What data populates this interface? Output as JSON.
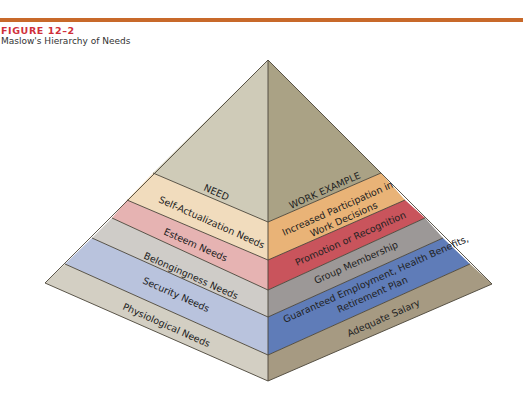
{
  "figure": {
    "number": "FIGURE 12–2",
    "title": "Maslow's Hierarchy of Needs",
    "accent_color": "#c8692a",
    "number_color": "#d0303a"
  },
  "pyramid": {
    "left_header": "NEED",
    "right_header": "WORK EXAMPLE",
    "levels": [
      {
        "need": "Self-Actualization Needs",
        "example_line1": "Increased Participation in",
        "example_line2": "Work Decisions",
        "left_color": "#f1dcbd",
        "right_color": "#e9b377"
      },
      {
        "need": "Esteem Needs",
        "example_line1": "Promotion or Recognition",
        "example_line2": "",
        "left_color": "#e6b3b2",
        "right_color": "#c9545c"
      },
      {
        "need": "Belongingness Needs",
        "example_line1": "Group Membership",
        "example_line2": "",
        "left_color": "#cfccc8",
        "right_color": "#9c9897"
      },
      {
        "need": "Security Needs",
        "example_line1": "Guaranteed Employment, Health Benefits,",
        "example_line2": "Retirement Plan",
        "left_color": "#b9c3dd",
        "right_color": "#5f7cb8"
      },
      {
        "need": "Physiological Needs",
        "example_line1": "Adequate Salary",
        "example_line2": "",
        "left_color": "#d3cfc3",
        "right_color": "#a69a82"
      }
    ],
    "top_left_color": "#cfcbb8",
    "top_right_color": "#aaa285"
  }
}
